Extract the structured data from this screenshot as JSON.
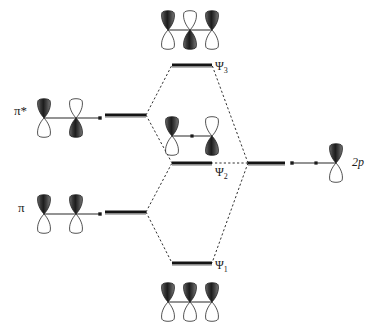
{
  "diagram": {
    "background_color": "#ffffff",
    "line_color": "#1a1a1a",
    "level_color": "#141414",
    "correlation_line_style": "dashed",
    "orbital_dark_color": "#2b2b2b",
    "orbital_light_color": "#ffffff",
    "orbital_outline_color": "#1a1a1a"
  },
  "labels": {
    "pi_star": "π*",
    "pi": "π",
    "psi3": "Ψ",
    "psi3_sub": "3",
    "psi2": "Ψ",
    "psi2_sub": "2",
    "psi1": "Ψ",
    "psi1_sub": "1",
    "two_p": "2p"
  },
  "energy_levels": [
    {
      "id": "pi-star",
      "label": "π*",
      "side": "left",
      "x1": 105,
      "x2": 146,
      "y": 115,
      "electrons": 0
    },
    {
      "id": "pi",
      "label": "π",
      "side": "left",
      "x1": 105,
      "x2": 146,
      "y": 212,
      "electrons": 0
    },
    {
      "id": "psi3",
      "label": "Ψ3",
      "side": "center",
      "x1": 172,
      "x2": 212,
      "y": 65,
      "electrons": 0
    },
    {
      "id": "psi2",
      "label": "Ψ2",
      "side": "center",
      "x1": 172,
      "x2": 212,
      "y": 163,
      "electrons": 0
    },
    {
      "id": "psi1",
      "label": "Ψ1",
      "side": "center",
      "x1": 172,
      "x2": 212,
      "y": 263,
      "electrons": 0
    },
    {
      "id": "two-p",
      "label": "2p",
      "side": "right",
      "x1": 248,
      "x2": 285,
      "y": 163,
      "electrons": 0
    }
  ],
  "correlation_lines": [
    {
      "from": "pi-star",
      "to": "psi3"
    },
    {
      "from": "pi-star",
      "to": "psi2"
    },
    {
      "from": "pi",
      "to": "psi2"
    },
    {
      "from": "pi",
      "to": "psi1"
    },
    {
      "from": "two-p",
      "to": "psi3"
    },
    {
      "from": "two-p",
      "to": "psi2"
    },
    {
      "from": "two-p",
      "to": "psi1"
    }
  ],
  "orbital_groups": [
    {
      "id": "pi-star-orbitals",
      "name": "pi-antibonding-orbital-picture",
      "linked_level": "pi-star",
      "center_y": 118,
      "lobes": [
        {
          "cx": 44,
          "top_phase": "dark"
        },
        {
          "cx": 76,
          "top_phase": "light"
        }
      ],
      "connector": {
        "x1": 44,
        "x2": 100
      },
      "node_dots": [],
      "end_dot_x": 100
    },
    {
      "id": "pi-orbitals",
      "name": "pi-bonding-orbital-picture",
      "linked_level": "pi",
      "center_y": 214,
      "lobes": [
        {
          "cx": 44,
          "top_phase": "dark"
        },
        {
          "cx": 76,
          "top_phase": "dark"
        }
      ],
      "connector": {
        "x1": 44,
        "x2": 100
      },
      "node_dots": [],
      "end_dot_x": 100
    },
    {
      "id": "psi3-orbitals",
      "name": "psi3-orbital-picture",
      "linked_level": "psi3",
      "center_y": 30,
      "lobes": [
        {
          "cx": 168,
          "top_phase": "dark"
        },
        {
          "cx": 190,
          "top_phase": "light"
        },
        {
          "cx": 212,
          "top_phase": "dark"
        }
      ],
      "connector": {
        "x1": 168,
        "x2": 212
      },
      "node_dots": [],
      "end_dot_x": null
    },
    {
      "id": "psi2-orbitals",
      "name": "psi2-orbital-picture",
      "linked_level": "psi2",
      "center_y": 136,
      "lobes": [
        {
          "cx": 172,
          "top_phase": "dark"
        },
        {
          "cx": 212,
          "top_phase": "light"
        }
      ],
      "connector": {
        "x1": 172,
        "x2": 212
      },
      "node_dots": [
        192
      ],
      "end_dot_x": null
    },
    {
      "id": "psi1-orbitals",
      "name": "psi1-orbital-picture",
      "linked_level": "psi1",
      "center_y": 302,
      "lobes": [
        {
          "cx": 168,
          "top_phase": "dark"
        },
        {
          "cx": 190,
          "top_phase": "dark"
        },
        {
          "cx": 212,
          "top_phase": "dark"
        }
      ],
      "connector": {
        "x1": 168,
        "x2": 212
      },
      "node_dots": [],
      "end_dot_x": null
    },
    {
      "id": "two-p-orbital",
      "name": "2p-orbital-picture",
      "linked_level": "two-p",
      "center_y": 163,
      "lobes": [
        {
          "cx": 336,
          "top_phase": "dark"
        }
      ],
      "connector": {
        "x1": 292,
        "x2": 336
      },
      "node_dots": [
        316
      ],
      "end_dot_x": 292
    }
  ],
  "label_positions": {
    "pi_star": {
      "x": 14,
      "y": 104
    },
    "pi": {
      "x": 18,
      "y": 201
    },
    "psi3": {
      "x": 215,
      "y": 60
    },
    "psi2": {
      "x": 215,
      "y": 166
    },
    "psi1": {
      "x": 215,
      "y": 259
    },
    "two_p": {
      "x": 352,
      "y": 156
    }
  }
}
